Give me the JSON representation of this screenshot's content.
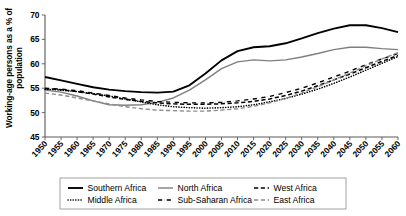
{
  "chart_data": {
    "type": "line",
    "title": "",
    "xlabel": "",
    "ylabel": "Working-age persons as a % of population",
    "ylim": [
      45,
      70
    ],
    "yticks": [
      45,
      50,
      55,
      60,
      65,
      70
    ],
    "xlim": [
      1950,
      2060
    ],
    "grid": false,
    "legend_position": "bottom",
    "x": [
      1950,
      1955,
      1960,
      1965,
      1970,
      1975,
      1980,
      1985,
      1990,
      1995,
      2000,
      2005,
      2010,
      2015,
      2020,
      2025,
      2030,
      2035,
      2040,
      2045,
      2050,
      2055,
      2060
    ],
    "categories": [
      "1950",
      "1955",
      "1960",
      "1965",
      "1970",
      "1975",
      "1980",
      "1985",
      "1990",
      "1995",
      "2000",
      "2005",
      "2010",
      "2015",
      "2020",
      "2025",
      "2030",
      "2035",
      "2040",
      "2045",
      "2050",
      "2055",
      "2060"
    ],
    "series": [
      {
        "name": "Southern Africa",
        "style": "solid",
        "color": "#000000",
        "width": 1.9,
        "values": [
          57.3,
          56.6,
          55.9,
          55.2,
          54.7,
          54.4,
          54.2,
          54.1,
          54.3,
          55.6,
          58.0,
          60.7,
          62.6,
          63.4,
          63.6,
          64.2,
          65.2,
          66.3,
          67.2,
          67.9,
          67.9,
          67.3,
          66.5
        ]
      },
      {
        "name": "North Africa",
        "style": "solid",
        "color": "#7f7f7f",
        "width": 1.4,
        "values": [
          54.6,
          54.2,
          53.4,
          52.4,
          51.6,
          51.5,
          51.6,
          52.1,
          53.0,
          54.6,
          56.7,
          59.0,
          60.4,
          60.8,
          60.6,
          60.8,
          61.4,
          62.1,
          62.9,
          63.4,
          63.4,
          63.1,
          62.9
        ]
      },
      {
        "name": "West Africa",
        "style": "dashed",
        "color": "#000000",
        "width": 1.5,
        "values": [
          54.9,
          54.7,
          54.3,
          53.8,
          53.2,
          52.7,
          52.3,
          52.0,
          51.8,
          51.7,
          51.7,
          51.8,
          52.0,
          52.3,
          52.8,
          53.5,
          54.4,
          55.5,
          56.7,
          57.9,
          59.2,
          60.5,
          61.7
        ]
      },
      {
        "name": "Middle Africa",
        "style": "dotted",
        "color": "#000000",
        "width": 1.6,
        "values": [
          54.8,
          54.6,
          54.3,
          53.9,
          53.4,
          52.8,
          52.2,
          51.6,
          51.2,
          51.0,
          50.9,
          51.0,
          51.2,
          51.6,
          52.2,
          52.9,
          53.8,
          54.8,
          56.0,
          57.3,
          58.7,
          60.1,
          61.5
        ]
      },
      {
        "name": "Sub-Saharan Africa",
        "style": "dashdot",
        "color": "#000000",
        "width": 1.4,
        "values": [
          55.0,
          54.8,
          54.5,
          54.0,
          53.5,
          53.0,
          52.6,
          52.3,
          52.1,
          52.0,
          52.0,
          52.1,
          52.4,
          52.8,
          53.3,
          54.1,
          55.0,
          56.1,
          57.3,
          58.5,
          59.8,
          61.0,
          62.1
        ]
      },
      {
        "name": "East Africa",
        "style": "dashed",
        "color": "#8c8c8c",
        "width": 1.4,
        "values": [
          54.0,
          53.6,
          53.0,
          52.4,
          51.8,
          51.2,
          50.8,
          50.5,
          50.4,
          50.3,
          50.3,
          50.5,
          50.8,
          51.3,
          52.0,
          52.9,
          54.0,
          55.3,
          56.7,
          58.1,
          59.6,
          61.0,
          62.3
        ]
      }
    ]
  },
  "legend": {
    "rows": [
      [
        {
          "label": "Southern Africa",
          "series": "Southern Africa"
        },
        {
          "label": "North Africa",
          "series": "North Africa"
        },
        {
          "label": "West Africa",
          "series": "West Africa"
        }
      ],
      [
        {
          "label": "Middle Africa",
          "series": "Middle Africa"
        },
        {
          "label": "Sub-Saharan Africa",
          "series": "Sub-Saharan Africa"
        },
        {
          "label": "East Africa",
          "series": "East Africa"
        }
      ]
    ]
  }
}
